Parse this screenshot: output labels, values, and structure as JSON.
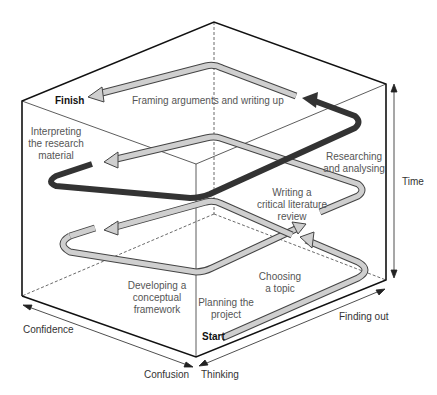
{
  "diagram": {
    "colors": {
      "box_edge": "#111111",
      "dashed_edge": "#444444",
      "path_fill": "#cfcfcf",
      "path_outline": "#444444",
      "highlight_path": "#333333",
      "label_text": "#555555"
    },
    "endpoints": {
      "start": "Start",
      "finish": "Finish"
    },
    "stages": [
      {
        "id": "planning",
        "text": "Planning the\nproject"
      },
      {
        "id": "choosing",
        "text": "Choosing\na topic"
      },
      {
        "id": "developing",
        "text": "Developing a\nconceptual\nframework"
      },
      {
        "id": "writing-review",
        "text": "Writing a\ncritical literature\nreview"
      },
      {
        "id": "researching",
        "text": "Researching\nand analysing"
      },
      {
        "id": "interpreting",
        "text": "Interpreting\nthe research\nmaterial"
      },
      {
        "id": "framing",
        "text": "Framing arguments and writing up"
      }
    ],
    "axes": {
      "time": "Time",
      "finding_out": "Finding out",
      "thinking": "Thinking",
      "confusion": "Confusion",
      "confidence": "Confidence"
    }
  }
}
